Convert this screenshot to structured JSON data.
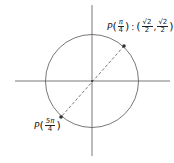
{
  "diagram": {
    "type": "unit-circle",
    "colors": {
      "stroke": "#555555",
      "point": "#333333",
      "text": "#222222"
    },
    "labels": {
      "p1": {
        "P": "P",
        "open": "(",
        "num": "π",
        "den": "4",
        "close": ")",
        "sep": ":",
        "x_num": "√2",
        "x_den": "2",
        "comma": ",",
        "y_num": "√2",
        "y_den": "2"
      },
      "p2": {
        "P": "P",
        "open": "(",
        "num": "5π",
        "den": "4",
        "close": ")"
      }
    }
  }
}
